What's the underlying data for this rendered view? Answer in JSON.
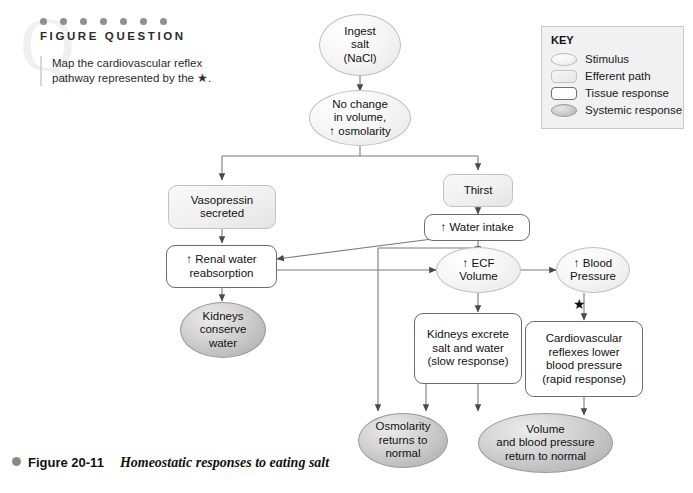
{
  "figure_question": {
    "heading": "FIGURE QUESTION",
    "watermark": "Q",
    "dot_count": 7,
    "text": "Map the cardiovascular reflex pathway represented by the ★."
  },
  "key": {
    "title": "KEY",
    "items": [
      {
        "shape": "ellipse-light",
        "label": "Stimulus"
      },
      {
        "shape": "rounded-rect-light",
        "label": "Efferent path"
      },
      {
        "shape": "rounded-rect-white",
        "label": "Tissue response"
      },
      {
        "shape": "ellipse-gray",
        "label": "Systemic response"
      }
    ]
  },
  "diagram": {
    "nodes": [
      {
        "id": "ingest",
        "type": "stimulus",
        "label": "Ingest\nsalt\n(NaCl)"
      },
      {
        "id": "osmolarity",
        "type": "stimulus",
        "label": "No change\nin volume,\n↑ osmolarity"
      },
      {
        "id": "vasopressin",
        "type": "efferent",
        "label": "Vasopressin\nsecreted"
      },
      {
        "id": "thirst",
        "type": "efferent",
        "label": "Thirst"
      },
      {
        "id": "renal",
        "type": "tissue",
        "label": "↑ Renal water\nreabsorption"
      },
      {
        "id": "water_intake",
        "type": "tissue",
        "label": "↑ Water intake"
      },
      {
        "id": "kidneys_conserve",
        "type": "systemic",
        "label": "Kidneys\nconserve\nwater"
      },
      {
        "id": "ecf",
        "type": "stimulus",
        "label": "↑ ECF\nVolume"
      },
      {
        "id": "bp",
        "type": "stimulus",
        "label": "↑ Blood\nPressure"
      },
      {
        "id": "kidneys_excrete",
        "type": "tissue",
        "label": "Kidneys excrete\nsalt and water\n(slow response)"
      },
      {
        "id": "cv_reflexes",
        "type": "tissue",
        "label": "Cardiovascular\nreflexes lower\nblood pressure\n(rapid response)"
      },
      {
        "id": "osm_normal",
        "type": "systemic",
        "label": "Osmolarity\nreturns to\nnormal"
      },
      {
        "id": "vol_normal",
        "type": "systemic",
        "label": "Volume\nand blood pressure\nreturn to normal"
      }
    ],
    "marker": "★"
  },
  "caption": {
    "number": "Figure 20-11",
    "title": "Homeostatic responses to eating salt"
  },
  "colors": {
    "stroke": "#6b6b6b",
    "systemic_fill": "#cfcfcf",
    "key_bg": "#f1f1f1",
    "dot_gray": "#8f8f8f"
  }
}
